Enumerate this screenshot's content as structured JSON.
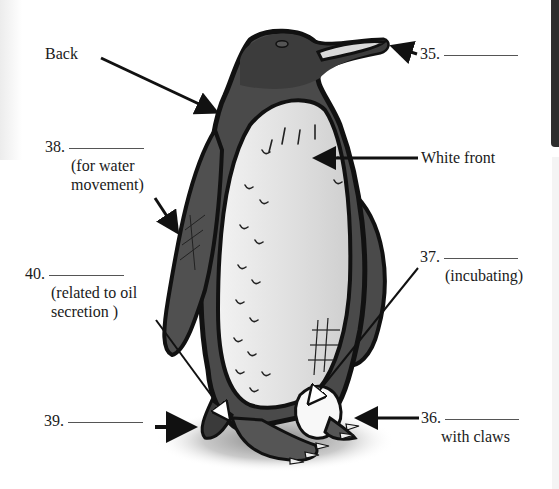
{
  "diagram": {
    "colors": {
      "background": "#ffffff",
      "outline": "#111111",
      "body_dark": "#4a4a4a",
      "belly": "#e6e6e6",
      "text": "#1a1a1a",
      "blank_line": "#555555"
    },
    "labels": [
      {
        "id": "back",
        "text": "Back",
        "subtext": "",
        "has_blank": false
      },
      {
        "id": "q35",
        "number": "35.",
        "blank": "",
        "subtext": "",
        "has_blank": true,
        "points_to": "beak"
      },
      {
        "id": "white-front",
        "text": "White front",
        "subtext": "",
        "has_blank": false
      },
      {
        "id": "q38",
        "number": "38.",
        "blank": "",
        "subtext_lines": [
          "(for water",
          "movement)"
        ],
        "has_blank": true,
        "points_to": "flipper"
      },
      {
        "id": "q37",
        "number": "37.",
        "blank": "",
        "subtext_lines": [
          "(incubating)"
        ],
        "has_blank": true,
        "points_to": "egg / brood pouch"
      },
      {
        "id": "q40",
        "number": "40.",
        "blank": "",
        "subtext_lines": [
          "(related to oil",
          "secretion )"
        ],
        "has_blank": true,
        "points_to": "tail base"
      },
      {
        "id": "q39",
        "number": "39.",
        "blank": "",
        "subtext_lines": [],
        "has_blank": true,
        "points_to": "tail"
      },
      {
        "id": "q36",
        "number": "36.",
        "blank": "",
        "subtext_lines": [
          "with claws"
        ],
        "has_blank": true,
        "points_to": "feet"
      }
    ]
  }
}
